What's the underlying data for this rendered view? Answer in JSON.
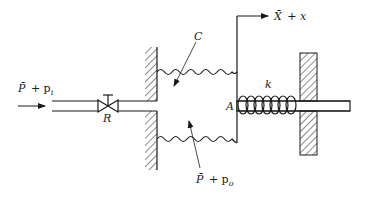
{
  "diagram": {
    "type": "pneumatic bellows actuator schematic",
    "labels": {
      "inlet_pressure": "P̄ + pᵢ",
      "inlet_pressure_base": "P̄",
      "inlet_pressure_plus": "+ p",
      "inlet_pressure_sub": "i",
      "valve": "R",
      "bellows": "C",
      "piston_area": "A",
      "spring": "k",
      "output_displacement": "X̄ + x",
      "output_displacement_base": "X̄",
      "output_displacement_plus": "+ x",
      "bellows_pressure": "P̄ + p₀",
      "bellows_pressure_base": "P̄",
      "bellows_pressure_plus": "+ p",
      "bellows_pressure_sub": "o"
    },
    "components": [
      {
        "name": "inlet-pipe",
        "description": "Double-line pipe carrying input pressure"
      },
      {
        "name": "valve-R",
        "description": "Restriction valve (resistance R)"
      },
      {
        "name": "left-wall",
        "description": "Fixed hatched wall with pipe opening"
      },
      {
        "name": "bellows-C",
        "description": "Corrugated bellows (capacitance C)"
      },
      {
        "name": "piston-plate-A",
        "description": "Movable end plate of area A"
      },
      {
        "name": "spring-k",
        "description": "Coil spring of stiffness k"
      },
      {
        "name": "right-wall",
        "description": "Fixed hatched wall guiding rod"
      },
      {
        "name": "rod",
        "description": "Output rod through right wall"
      }
    ],
    "colors": {
      "ink": "#1a1a1a",
      "background": "#ffffff"
    }
  }
}
